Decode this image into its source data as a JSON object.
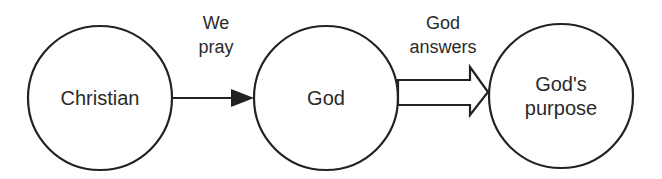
{
  "diagram": {
    "nodes": [
      {
        "id": "christian",
        "label": "Christian"
      },
      {
        "id": "god",
        "label": "God"
      },
      {
        "id": "gods_purpose",
        "label_line1": "God's",
        "label_line2": "purpose"
      }
    ],
    "edges": [
      {
        "from": "christian",
        "to": "god",
        "style": "solid-arrow",
        "label_line1": "We",
        "label_line2": "pray"
      },
      {
        "from": "god",
        "to": "gods_purpose",
        "style": "hollow-block-arrow",
        "label_line1": "God",
        "label_line2": "answers"
      }
    ],
    "colors": {
      "stroke": "#222222",
      "text": "#2a2a2a",
      "background": "#ffffff"
    }
  }
}
